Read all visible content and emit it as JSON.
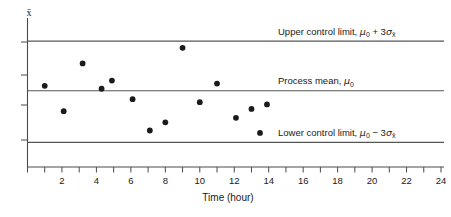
{
  "chart_data": {
    "type": "scatter",
    "title": "",
    "xlabel": "Time (hour)",
    "ylabel": "x̄",
    "xlim": [
      0,
      24
    ],
    "ylim": [
      0,
      1
    ],
    "grid": false,
    "legend_position": "inline-right",
    "x_ticks": [
      0,
      1,
      2,
      3,
      4,
      5,
      6,
      7,
      8,
      9,
      10,
      11,
      12,
      13,
      14,
      15,
      16,
      17,
      18,
      19,
      20,
      21,
      22,
      23,
      24
    ],
    "x_tick_labels": [
      "2",
      "4",
      "6",
      "8",
      "10",
      "12",
      "14",
      "16",
      "18",
      "20",
      "22",
      "24"
    ],
    "x_tick_label_values": [
      2,
      4,
      6,
      8,
      10,
      12,
      14,
      16,
      18,
      20,
      22,
      24
    ],
    "y_ticks": [
      0.3,
      0.52,
      0.72,
      0.95
    ],
    "y_tick_labels": [],
    "reference_lines": [
      {
        "name": "upper-control-limit",
        "value": 0.845,
        "label_text": "Upper control limit, ",
        "label_mu": "μ",
        "label_mu_sub": "0",
        "label_op": " + 3",
        "label_sigma": "σ",
        "label_sigma_sub": "x̄"
      },
      {
        "name": "process-mean",
        "value": 0.512,
        "label_text": "Process mean, ",
        "label_mu": "μ",
        "label_mu_sub": "0",
        "label_op": "",
        "label_sigma": "",
        "label_sigma_sub": ""
      },
      {
        "name": "lower-control-limit",
        "value": 0.165,
        "label_text": "Lower control limit, ",
        "label_mu": "μ",
        "label_mu_sub": "0",
        "label_op": " − 3",
        "label_sigma": "σ",
        "label_sigma_sub": "x̄"
      }
    ],
    "series": [
      {
        "name": "sample-means",
        "marker": "filled-circle",
        "color": "#1b1b1b",
        "points": [
          {
            "x": 1.0,
            "y": 0.545
          },
          {
            "x": 2.1,
            "y": 0.375
          },
          {
            "x": 3.2,
            "y": 0.695
          },
          {
            "x": 4.3,
            "y": 0.525
          },
          {
            "x": 4.9,
            "y": 0.58
          },
          {
            "x": 6.1,
            "y": 0.455
          },
          {
            "x": 7.1,
            "y": 0.245
          },
          {
            "x": 8.0,
            "y": 0.3
          },
          {
            "x": 9.0,
            "y": 0.8
          },
          {
            "x": 10.0,
            "y": 0.435
          },
          {
            "x": 11.0,
            "y": 0.56
          },
          {
            "x": 12.1,
            "y": 0.33
          },
          {
            "x": 13.0,
            "y": 0.39
          },
          {
            "x": 13.9,
            "y": 0.42
          }
        ]
      }
    ],
    "legend": [
      {
        "marker": "filled-circle",
        "label": "sample-mean-point"
      }
    ]
  }
}
